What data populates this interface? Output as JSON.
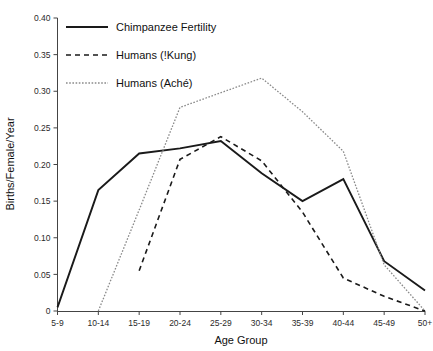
{
  "chart_data": {
    "type": "line",
    "title": "",
    "xlabel": "Age Group",
    "ylabel": "Births/Female/Year",
    "categories": [
      "5-9",
      "10-14",
      "15-19",
      "20-24",
      "25-29",
      "30-34",
      "35-39",
      "40-44",
      "45-49",
      "50+"
    ],
    "ylim": [
      0,
      0.4
    ],
    "yticks": [
      "0",
      "0.05",
      "0.10",
      "0.15",
      "0.20",
      "0.25",
      "0.30",
      "0.35",
      "0.40"
    ],
    "ytick_values": [
      0,
      0.05,
      0.1,
      0.15,
      0.2,
      0.25,
      0.3,
      0.35,
      0.4
    ],
    "grid": false,
    "legend_position": "top-left",
    "series": [
      {
        "name": "Chimpanzee Fertility",
        "style": "solid",
        "color": "#1a1a1a",
        "values": [
          0.005,
          0.165,
          0.215,
          0.222,
          0.232,
          0.188,
          0.15,
          0.18,
          0.068,
          0.028
        ]
      },
      {
        "name": "Humans (!Kung)",
        "style": "dashed",
        "color": "#1a1a1a",
        "values": [
          null,
          null,
          0.055,
          0.207,
          0.238,
          0.205,
          0.135,
          0.045,
          0.02,
          0.0
        ]
      },
      {
        "name": "Humans (Aché)",
        "style": "dotted",
        "color": "#8a8a8a",
        "values": [
          null,
          0.0,
          0.138,
          0.278,
          0.298,
          0.318,
          0.272,
          0.218,
          0.063,
          0.0
        ]
      }
    ]
  },
  "legend": {
    "items": [
      {
        "label": "Chimpanzee Fertility"
      },
      {
        "label": "Humans (!Kung)"
      },
      {
        "label": "Humans (Aché)"
      }
    ]
  },
  "axes": {
    "x_title": "Age Group",
    "y_title": "Births/Female/Year"
  }
}
